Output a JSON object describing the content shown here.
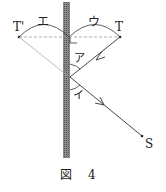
{
  "labels": {
    "t_prime": "T'",
    "t": "T",
    "e": "エ",
    "u": "ウ",
    "a": "ア",
    "i": "イ",
    "s": "S"
  },
  "caption": {
    "prefix": "図",
    "number": "4"
  },
  "colors": {
    "line": "#333333",
    "mirror": "#777777",
    "dashed": "#999999"
  }
}
